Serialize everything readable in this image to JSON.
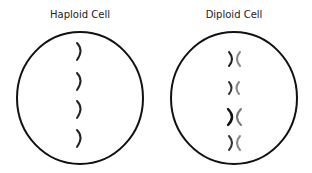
{
  "diagram": {
    "panels": [
      {
        "title": "Haploid Cell",
        "chromosome_count": 4,
        "chromosome_type": "single"
      },
      {
        "title": "Diploid Cell",
        "chromosome_count": 4,
        "chromosome_type": "homologous-pair"
      }
    ],
    "colors": {
      "outline": "#111111",
      "chromosome_dark": "#222222",
      "chromosome_light": "#777777"
    }
  }
}
